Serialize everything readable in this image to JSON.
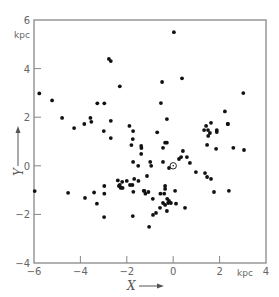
{
  "chart_data": {
    "type": "scatter",
    "title": "",
    "xlabel": "X",
    "ylabel": "Y",
    "x_unit": "kpc",
    "y_unit": "kpc",
    "xlim": [
      -6,
      4
    ],
    "ylim": [
      -4,
      6
    ],
    "x_ticks": [
      -6,
      -4,
      -2,
      0,
      2,
      4
    ],
    "y_ticks": [
      -4,
      -2,
      0,
      2,
      4,
      6
    ],
    "x_tick_labels": [
      "-6",
      "-4",
      "-2",
      "0",
      "2",
      "kpc",
      "4"
    ],
    "y_tick_labels": [
      "-4",
      "-2",
      "0",
      "2",
      "4",
      "6"
    ],
    "grid": false,
    "legend": null,
    "annotations": [
      {
        "type": "sun-symbol",
        "x": 0.0,
        "y": 0.0,
        "label": "Sun (⊙)"
      }
    ],
    "series": [
      {
        "name": "objects",
        "points": [
          [
            0.03,
            5.5
          ],
          [
            -2.77,
            4.4
          ],
          [
            -2.69,
            4.31
          ],
          [
            -2.3,
            3.27
          ],
          [
            -5.77,
            2.98
          ],
          [
            -5.22,
            2.69
          ],
          [
            -3.27,
            2.57
          ],
          [
            -2.97,
            2.57
          ],
          [
            -4.79,
            1.97
          ],
          [
            -3.57,
            1.97
          ],
          [
            -3.53,
            1.81
          ],
          [
            -2.69,
            1.85
          ],
          [
            -3.83,
            1.72
          ],
          [
            -4.27,
            1.55
          ],
          [
            -1.89,
            1.64
          ],
          [
            -2.99,
            1.43
          ],
          [
            -1.73,
            1.43
          ],
          [
            -2.69,
            1.14
          ],
          [
            -1.74,
            1.1
          ],
          [
            -1.37,
            0.73
          ],
          [
            -0.48,
            3.45
          ],
          [
            0.38,
            3.6
          ],
          [
            -0.53,
            2.58
          ],
          [
            -0.27,
            1.92
          ],
          [
            -0.69,
            1.38
          ],
          [
            3.02,
            2.99
          ],
          [
            2.23,
            2.24
          ],
          [
            2.36,
            1.72
          ],
          [
            1.33,
            1.47
          ],
          [
            1.42,
            1.64
          ],
          [
            1.63,
            1.77
          ],
          [
            1.88,
            1.47
          ],
          [
            1.88,
            1.39
          ],
          [
            1.5,
            1.47
          ],
          [
            1.58,
            1.35
          ],
          [
            1.51,
            1.23
          ],
          [
            2.35,
            1.72
          ],
          [
            1.46,
            0.86
          ],
          [
            1.85,
            0.7
          ],
          [
            2.59,
            0.74
          ],
          [
            3.05,
            0.65
          ],
          [
            -0.27,
            0.95
          ],
          [
            -1.8,
            0.85
          ],
          [
            -1.38,
            0.82
          ],
          [
            -1.38,
            0.49
          ],
          [
            -0.35,
            0.95
          ],
          [
            -0.44,
            0.74
          ],
          [
            -1.73,
            0.16
          ],
          [
            -1.51,
            0.0
          ],
          [
            -0.99,
            0.16
          ],
          [
            -0.95,
            0.0
          ],
          [
            -0.44,
            0.16
          ],
          [
            -0.18,
            -0.09
          ],
          [
            0.42,
            0.61
          ],
          [
            0.34,
            0.36
          ],
          [
            0.25,
            0.28
          ],
          [
            0.59,
            0.36
          ],
          [
            0.72,
            0.12
          ],
          [
            0.98,
            -0.26
          ],
          [
            1.37,
            -0.3
          ],
          [
            1.46,
            -0.46
          ],
          [
            1.63,
            -0.54
          ],
          [
            1.76,
            -1.08
          ],
          [
            2.4,
            -1.03
          ],
          [
            -1.13,
            -0.42
          ],
          [
            -1.68,
            -0.54
          ],
          [
            -0.35,
            -0.83
          ],
          [
            -0.35,
            -0.95
          ],
          [
            -1.27,
            -1.03
          ],
          [
            -1.07,
            -1.08
          ],
          [
            -0.55,
            -1.15
          ],
          [
            -0.39,
            -1.15
          ],
          [
            0.08,
            -1.03
          ],
          [
            -5.97,
            -1.04
          ],
          [
            -4.53,
            -1.11
          ],
          [
            -3.41,
            -1.1
          ],
          [
            -3.8,
            -1.32
          ],
          [
            -3.29,
            -1.56
          ],
          [
            -2.97,
            -1.15
          ],
          [
            -2.98,
            -2.11
          ],
          [
            -2.97,
            -0.83
          ],
          [
            -2.34,
            -0.83
          ],
          [
            -2.26,
            -0.91
          ],
          [
            -2.18,
            -0.91
          ],
          [
            -2.39,
            -0.6
          ],
          [
            -2.2,
            -0.66
          ],
          [
            -2.0,
            -0.62
          ],
          [
            -2.3,
            -0.79
          ],
          [
            -1.86,
            -0.79
          ],
          [
            -1.76,
            -0.79
          ],
          [
            -1.5,
            -0.62
          ],
          [
            -1.72,
            -1.07
          ],
          [
            -1.2,
            -1.15
          ],
          [
            -1.24,
            -1.03
          ],
          [
            -0.88,
            -1.36
          ],
          [
            -0.26,
            -1.36
          ],
          [
            -0.18,
            -1.45
          ],
          [
            -0.1,
            -1.53
          ],
          [
            -0.22,
            -1.53
          ],
          [
            -0.44,
            -1.53
          ],
          [
            -0.35,
            -1.61
          ],
          [
            0.12,
            -1.56
          ],
          [
            0.51,
            -1.73
          ],
          [
            -0.57,
            -1.73
          ],
          [
            -0.27,
            -1.86
          ],
          [
            -0.74,
            -1.94
          ],
          [
            -0.87,
            -2.02
          ],
          [
            -1.74,
            -2.07
          ],
          [
            -1.04,
            -2.51
          ]
        ]
      }
    ]
  },
  "labels": {
    "y_unit": "kpc",
    "x_unit": "kpc",
    "x_axis_title": "X",
    "y_axis_title": "Y",
    "sun_symbol": "⊙"
  }
}
